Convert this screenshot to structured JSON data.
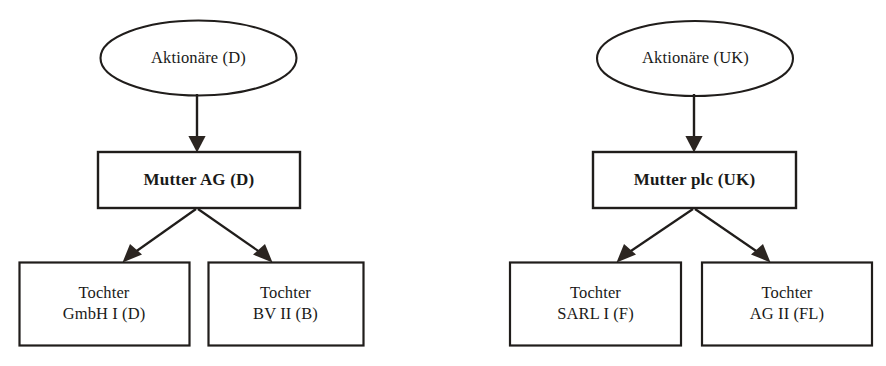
{
  "diagram": {
    "colors": {
      "background": "#ffffff",
      "stroke": "#201d1b",
      "text": "#1a1a18",
      "arrow_fill": "#2b2521"
    },
    "groups": [
      {
        "id": "group-de",
        "name": "german-group",
        "shareholders": {
          "shape": "ellipse",
          "label": "Aktionäre (D)"
        },
        "parent": {
          "shape": "rectangle",
          "label": "Mutter AG (D)",
          "bold": true
        },
        "subsidiaries": [
          {
            "shape": "rectangle",
            "label": "Tochter\nGmbH I (D)",
            "line1": "Tochter",
            "line2": "GmbH I (D)"
          },
          {
            "shape": "rectangle",
            "label": "Tochter\nBV II (B)",
            "line1": "Tochter",
            "line2": "BV II (B)"
          }
        ]
      },
      {
        "id": "group-uk",
        "name": "uk-group",
        "shareholders": {
          "shape": "ellipse",
          "label": "Aktionäre (UK)"
        },
        "parent": {
          "shape": "rectangle",
          "label": "Mutter plc (UK)",
          "bold": true
        },
        "subsidiaries": [
          {
            "shape": "rectangle",
            "label": "Tochter\nSARL I (F)",
            "line1": "Tochter",
            "line2": "SARL I (F)"
          },
          {
            "shape": "rectangle",
            "label": "Tochter\nAG II (FL)",
            "line1": "Tochter",
            "line2": "AG II (FL)"
          }
        ]
      }
    ]
  }
}
